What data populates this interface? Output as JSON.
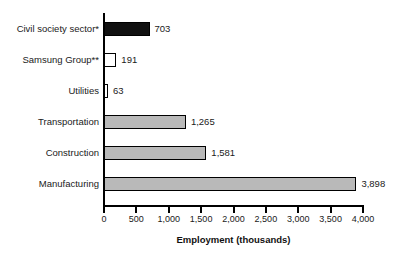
{
  "chart_data": {
    "type": "bar",
    "orientation": "horizontal",
    "title": "",
    "xlabel": "Employment (thousands)",
    "ylabel": "",
    "xlim": [
      0,
      4000
    ],
    "xticks": [
      0,
      500,
      1000,
      1500,
      2000,
      2500,
      3000,
      3500,
      4000
    ],
    "xtick_labels": [
      "0",
      "500",
      "1,000",
      "1,500",
      "2,000",
      "2,500",
      "3,000",
      "3,500",
      "4,000"
    ],
    "grid": false,
    "legend": null,
    "categories": [
      "Civil society sector*",
      "Samsung Group**",
      "Utilities",
      "Transportation",
      "Construction",
      "Manufacturing"
    ],
    "values": [
      703,
      191,
      63,
      1265,
      1581,
      3898
    ],
    "value_labels": [
      "703",
      "191",
      "63",
      "1,265",
      "1,581",
      "3,898"
    ],
    "bar_colors": [
      "#111111",
      "#ffffff",
      "#ffffff",
      "#b9b9b9",
      "#b9b9b9",
      "#b9b9b9"
    ],
    "bar_fill_classes": [
      "fill-dark",
      "fill-white",
      "fill-white",
      "fill-gray",
      "fill-gray",
      "fill-gray"
    ],
    "bar_edge_color": "#000000",
    "background_color": "#ffffff"
  },
  "axis": {
    "title": "Employment (thousands)"
  }
}
